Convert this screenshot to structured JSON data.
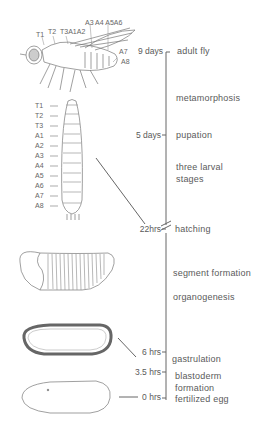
{
  "timeline": {
    "ticks": [
      {
        "time": "9 days",
        "stage": "adult fly"
      },
      {
        "time": "5 days",
        "stage": "pupation"
      },
      {
        "time": "22hrs",
        "stage": "hatching"
      },
      {
        "time": "6 hrs",
        "stage": "gastrulation"
      },
      {
        "time": "3.5 hrs",
        "stage": "blastoderm formation"
      },
      {
        "time": "0 hrs",
        "stage": "fertilized egg"
      }
    ],
    "intervals": [
      {
        "label": "metamorphosis"
      },
      {
        "label": "three larval stages"
      },
      {
        "label": "segment formation"
      },
      {
        "label": "organogenesis"
      }
    ]
  },
  "labels": {
    "t9": "9 days",
    "adult": "adult fly",
    "meta": "metamorphosis",
    "t5": "5 days",
    "pupation": "pupation",
    "larval1": "three  larval",
    "larval2": "stages",
    "t22": "22hrs",
    "hatching": "hatching",
    "segment": "segment  formation",
    "organo": "organogenesis",
    "t6": "6 hrs",
    "gastrulation": "gastrulation",
    "t35": "3.5 hrs",
    "blasto1": "blastoderm",
    "blasto2": "formation",
    "t0": "0 hrs",
    "egg": "fertilized  egg"
  },
  "fly_segments": [
    "T1",
    "T2",
    "T3A1A2",
    "A3 A4 A5A6",
    "A7",
    "A8"
  ],
  "larva_segments": [
    "T1",
    "T2",
    "T3",
    "A1",
    "A2",
    "A3",
    "A4",
    "A5",
    "A6",
    "A7",
    "A8"
  ]
}
